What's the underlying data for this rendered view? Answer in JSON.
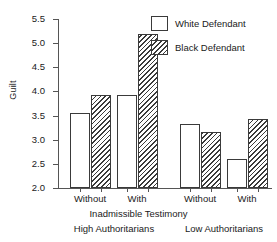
{
  "chart_data": {
    "type": "bar",
    "title": "",
    "xlabel": "Inadmissible Testimony",
    "ylabel": "Guilt",
    "ylim": [
      2.0,
      5.5
    ],
    "ytick_labels": [
      "5.5",
      "5.0",
      "4.5",
      "4.0",
      "3.5",
      "3.0",
      "2.5",
      "2.0"
    ],
    "ytick_values": [
      5.5,
      5.0,
      4.5,
      4.0,
      3.5,
      3.0,
      2.5,
      2.0
    ],
    "grid": false,
    "legend_position": "top-right",
    "categories": [
      "Without",
      "With",
      "Without",
      "With"
    ],
    "group_labels": [
      "High Authoritarians",
      "Low Authoritarians"
    ],
    "series": [
      {
        "name": "White Defendant",
        "fill": "open",
        "values": [
          3.55,
          3.93,
          3.33,
          2.61
        ]
      },
      {
        "name": "Black Defendant",
        "fill": "hatched",
        "values": [
          3.93,
          5.19,
          3.16,
          3.42
        ]
      }
    ]
  },
  "axis": {
    "y_title": "Guilt",
    "x_title": "Inadmissible Testimony",
    "ticks": [
      {
        "label": "5.5",
        "value": 5.5
      },
      {
        "label": "5.0",
        "value": 5.0
      },
      {
        "label": "4.5",
        "value": 4.5
      },
      {
        "label": "4.0",
        "value": 4.0
      },
      {
        "label": "3.5",
        "value": 3.5
      },
      {
        "label": "3.0",
        "value": 3.0
      },
      {
        "label": "2.5",
        "value": 2.5
      },
      {
        "label": "2.0",
        "value": 2.0
      }
    ],
    "category_labels": [
      "Without",
      "With",
      "Without",
      "With"
    ],
    "group_labels": [
      "High Authoritarians",
      "Low Authoritarians"
    ]
  },
  "legend": {
    "items": [
      {
        "label": "White Defendant",
        "pattern": "open"
      },
      {
        "label": "Black Defendant",
        "pattern": "hatched"
      }
    ]
  },
  "style": {
    "line_color": "#3a3a3a",
    "axis_color": "#555555",
    "background": "#ffffff",
    "text_color": "#1a1a1a"
  }
}
